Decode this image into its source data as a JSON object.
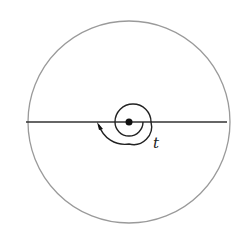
{
  "diagram": {
    "type": "circle-with-diameter-and-spiral",
    "outer_circle": {
      "cx": 129,
      "cy": 122,
      "r": 101,
      "stroke": "#9a9a9a"
    },
    "diameter_line": {
      "x1": 26,
      "x2": 227,
      "y": 122,
      "stroke": "#333333"
    },
    "center_point": {
      "cx": 129,
      "cy": 122,
      "r": 3.5,
      "fill": "#111111"
    },
    "spiral": {
      "stroke": "#222222",
      "arrow_direction": "counterclockwise-upward"
    },
    "label": {
      "text": "t"
    }
  }
}
